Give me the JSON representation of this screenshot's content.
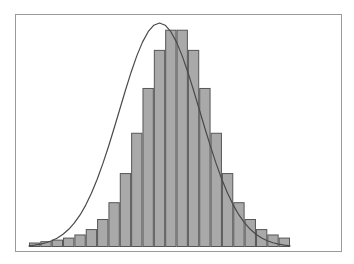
{
  "figure": {
    "background_color": "#ffffff",
    "frame": {
      "name": "plot-frame",
      "x": 15,
      "y": 14,
      "width": 327,
      "height": 238,
      "stroke_color": "#9a9a9a",
      "stroke_width": 1,
      "fill_color": "#ffffff"
    },
    "title": "",
    "subtitle": "",
    "caption": ""
  },
  "chart_data": {
    "type": "bar",
    "title": "",
    "subtitle": "",
    "xlabel": "",
    "ylabel": "",
    "grid": false,
    "legend": false,
    "legend_position": "none",
    "axis_ticks": false,
    "tick_labels": [],
    "categories": [
      "1",
      "2",
      "3",
      "4",
      "5",
      "6",
      "7",
      "8",
      "9",
      "10",
      "11",
      "12",
      "13",
      "14",
      "15",
      "16",
      "17",
      "18",
      "19",
      "20",
      "21",
      "22",
      "23"
    ],
    "values": [
      2.0,
      2.6,
      3.3,
      4.2,
      5.6,
      8.0,
      12.5,
      20.0,
      33.0,
      51.0,
      71.0,
      88.0,
      97.0,
      97.0,
      88.0,
      71.0,
      51.0,
      33.0,
      20.0,
      12.5,
      8.0,
      5.6,
      4.2
    ],
    "ylim": [
      0,
      100
    ],
    "xlim": [
      0,
      23
    ],
    "bar_fill_color": "#a9a9a9",
    "bar_edge_color": "#565656",
    "bar_edge_width": 1,
    "n_bars": 23,
    "baseline_y": 247,
    "bars_left_x": 29,
    "bars_right_x": 290,
    "plot_top_y": 23,
    "overlay": {
      "name": "normal-density-curve",
      "type": "line",
      "stroke_color": "#4a4a4a",
      "stroke_width": 1.2,
      "fill": "none",
      "peak_value": 100,
      "mean_index": 11.5,
      "std_dev_bars": 3.55,
      "x_samples": [
        0.0,
        0.5,
        1.0,
        1.5,
        2.0,
        2.5,
        3.0,
        3.5,
        4.0,
        4.5,
        5.0,
        5.5,
        6.0,
        6.5,
        7.0,
        7.5,
        8.0,
        8.5,
        9.0,
        9.5,
        10.0,
        10.5,
        11.0,
        11.5,
        12.0,
        12.5,
        13.0,
        13.5,
        14.0,
        14.5,
        15.0,
        15.5,
        16.0,
        16.5,
        17.0,
        17.5,
        18.0,
        18.5,
        19.0,
        19.5,
        20.0,
        20.5,
        21.0,
        21.5,
        22.0,
        22.5,
        23.0
      ]
    }
  }
}
